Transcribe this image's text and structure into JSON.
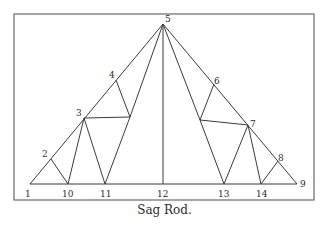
{
  "figure": {
    "caption": "Sag Rod.",
    "frame": {
      "x": 14,
      "y": 14,
      "width": 300,
      "height": 186
    },
    "colors": {
      "line": "#3a3a3a",
      "frame": "#6a6a6a",
      "text": "#2a2a2a"
    },
    "nodes": [
      {
        "id": "1",
        "x": 30,
        "y": 184,
        "lx": 25,
        "ly": 197
      },
      {
        "id": "2",
        "x": 51,
        "y": 159,
        "lx": 42,
        "ly": 157
      },
      {
        "id": "3",
        "x": 84,
        "y": 118,
        "lx": 76,
        "ly": 116
      },
      {
        "id": "4",
        "x": 116,
        "y": 80,
        "lx": 109,
        "ly": 78
      },
      {
        "id": "5",
        "x": 163,
        "y": 24,
        "lx": 165,
        "ly": 22
      },
      {
        "id": "6",
        "x": 214,
        "y": 84,
        "lx": 214,
        "ly": 84
      },
      {
        "id": "7",
        "x": 248,
        "y": 125,
        "lx": 250,
        "ly": 127
      },
      {
        "id": "8",
        "x": 278,
        "y": 161,
        "lx": 278,
        "ly": 161
      },
      {
        "id": "9",
        "x": 297,
        "y": 184,
        "lx": 300,
        "ly": 187
      },
      {
        "id": "10",
        "x": 68,
        "y": 184,
        "lx": 62,
        "ly": 197
      },
      {
        "id": "11",
        "x": 105,
        "y": 184,
        "lx": 100,
        "ly": 197
      },
      {
        "id": "12",
        "x": 163,
        "y": 184,
        "lx": 157,
        "ly": 197
      },
      {
        "id": "13",
        "x": 224,
        "y": 184,
        "lx": 218,
        "ly": 197
      },
      {
        "id": "14",
        "x": 261,
        "y": 184,
        "lx": 256,
        "ly": 197
      }
    ],
    "inner_points": [
      {
        "id": "a",
        "x": 130,
        "y": 117
      },
      {
        "id": "b",
        "x": 200,
        "y": 120
      }
    ],
    "members": [
      [
        "1",
        "5"
      ],
      [
        "5",
        "9"
      ],
      [
        "1",
        "9"
      ],
      [
        "2",
        "10"
      ],
      [
        "3",
        "10"
      ],
      [
        "3",
        "11"
      ],
      [
        "3",
        "a"
      ],
      [
        "4",
        "a"
      ],
      [
        "a",
        "11"
      ],
      [
        "5",
        "a"
      ],
      [
        "5",
        "12"
      ],
      [
        "5",
        "b"
      ],
      [
        "6",
        "b"
      ],
      [
        "b",
        "7"
      ],
      [
        "b",
        "13"
      ],
      [
        "7",
        "13"
      ],
      [
        "7",
        "14"
      ],
      [
        "8",
        "14"
      ]
    ]
  }
}
